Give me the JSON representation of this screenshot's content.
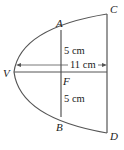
{
  "diagram": {
    "type": "parabolic-reflector-cross-section",
    "points": {
      "vertex": "V",
      "top_chord_end": "A",
      "bottom_chord_end": "B",
      "focus": "F",
      "top_right": "C",
      "bottom_right": "D"
    },
    "measurements": {
      "upper_half_chord": "5 cm",
      "lower_half_chord": "5 cm",
      "depth": "11 cm"
    },
    "colors": {
      "stroke": "#555555",
      "text": "#222222",
      "background": "#ffffff"
    }
  }
}
